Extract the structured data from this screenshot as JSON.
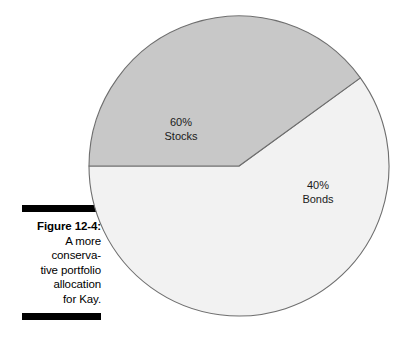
{
  "figure": {
    "label": "Figure 12-4:",
    "caption_lines": [
      "A more",
      "conserva-",
      "tive portfolio",
      "allocation",
      "for Kay."
    ],
    "rule_color": "#000000"
  },
  "chart_data": {
    "type": "pie",
    "title": "",
    "categories": [
      "Stocks",
      "Bonds"
    ],
    "values": [
      60,
      40
    ],
    "unit": "%",
    "labels": [
      "60%",
      "40%"
    ],
    "slice_colors": [
      "#f2f2f2",
      "#c8c8c8"
    ],
    "outline_color": "#6e6e6e",
    "start_angle_deg": 180,
    "direction": "counterclockwise",
    "legend": "none",
    "grid": false,
    "center": {
      "x": 153,
      "y": 154
    },
    "radius": 150,
    "slices": [
      {
        "name": "Stocks",
        "percent": 60,
        "percent_label": "60%",
        "sweep_deg": 216,
        "color": "#f2f2f2"
      },
      {
        "name": "Bonds",
        "percent": 40,
        "percent_label": "40%",
        "sweep_deg": 144,
        "color": "#c8c8c8"
      }
    ]
  }
}
